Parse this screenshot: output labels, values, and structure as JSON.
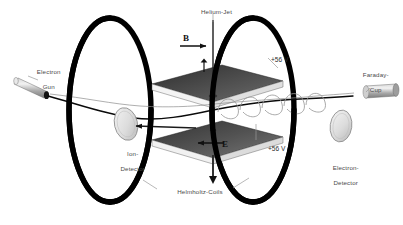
{
  "figure": {
    "width": 403,
    "height": 225,
    "background": "#ffffff"
  },
  "colors": {
    "coil": "#000000",
    "plate_dark": "#3f3f3f",
    "plate_light": "#e8e8e8",
    "beam": "#000000",
    "label_text": "#4a4a4a",
    "field_text": "#111111",
    "detector_fill": "#d8d8d8",
    "tube_fill": "#b4b4b4"
  },
  "labels": {
    "electron_gun": {
      "line1": "Electron",
      "line2": "Gun"
    },
    "helium_jet": {
      "text": "Helium-Jet"
    },
    "faraday_cup": {
      "line1": "Faraday-",
      "line2": "Cup"
    },
    "electron_detector": {
      "line1": "Electron-",
      "line2": "Detector"
    },
    "ion_detector": {
      "line1": "Ion-",
      "line2": "Detector"
    },
    "helmholtz_coils": {
      "text": "Helmholtz-Coils"
    }
  },
  "fields": {
    "magnetic": {
      "symbol": "B",
      "direction": "right",
      "name": "magnetic-field"
    },
    "electric": {
      "symbol": "E",
      "direction": "left",
      "name": "electric-field"
    }
  },
  "electrodes": [
    {
      "id": "upper-plate",
      "voltage": "+56 V"
    },
    {
      "id": "lower-plate",
      "voltage": "+56 V"
    }
  ],
  "components": [
    {
      "name": "electron-gun",
      "type": "source"
    },
    {
      "name": "helium-jet",
      "type": "target-gas"
    },
    {
      "name": "upper-electrode-plate",
      "type": "electrode"
    },
    {
      "name": "lower-electrode-plate",
      "type": "electrode"
    },
    {
      "name": "ion-detector",
      "type": "detector"
    },
    {
      "name": "electron-detector",
      "type": "detector"
    },
    {
      "name": "faraday-cup",
      "type": "beam-dump"
    },
    {
      "name": "helmholtz-coil-left",
      "type": "coil"
    },
    {
      "name": "helmholtz-coil-right",
      "type": "coil"
    },
    {
      "name": "electron-beam-trajectory",
      "type": "trajectory"
    },
    {
      "name": "helical-electron-trajectory",
      "type": "trajectory"
    }
  ]
}
